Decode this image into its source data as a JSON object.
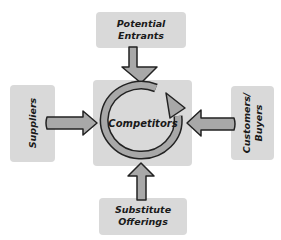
{
  "diagram": {
    "type": "five-forces",
    "center": {
      "label": "Competitors"
    },
    "nodes": {
      "top": {
        "label": "Potential\nEntrants"
      },
      "left": {
        "label": "Suppliers"
      },
      "right": {
        "label": "Customers/\nBuyers"
      },
      "bottom": {
        "label": "Substitute\nOfferings"
      }
    },
    "edges": [
      {
        "from": "Potential Entrants",
        "to": "Competitors"
      },
      {
        "from": "Suppliers",
        "to": "Competitors"
      },
      {
        "from": "Customers/Buyers",
        "to": "Competitors"
      },
      {
        "from": "Substitute Offerings",
        "to": "Competitors"
      }
    ],
    "colors": {
      "box_fill": "#d9d9d9",
      "arrow_fill": "#a8a8a8",
      "outline": "#222222",
      "text": "#1a1a1a"
    }
  }
}
